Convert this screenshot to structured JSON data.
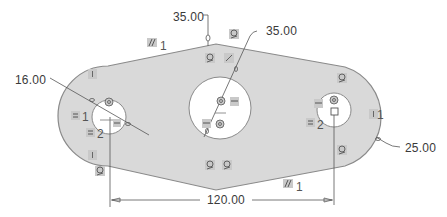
{
  "sketch": {
    "fill_color": "#d9d9d9",
    "outline_color": "#8a8a8a",
    "dimension_color": "#4a4a4a",
    "constraint_bg": "#c9c9c9"
  },
  "dimensions": {
    "top_width": "35.00",
    "center_hole_diameter": "35.00",
    "left_hole_diameter": "16.00",
    "right_radius": "25.00",
    "center_distance": "120.00"
  },
  "constraints": {
    "parallel_top_label": "1",
    "parallel_bottom_label": "1",
    "equal_left_1": "1",
    "equal_left_2": "2",
    "equal_right_2": "2",
    "equal_right_1": "1"
  },
  "icons": {
    "parallel": "parallel-constraint-icon",
    "tangent": "tangent-constraint-icon",
    "equal": "equal-constraint-icon",
    "vertical": "vertical-constraint-icon",
    "coincident": "coincident-constraint-icon"
  }
}
